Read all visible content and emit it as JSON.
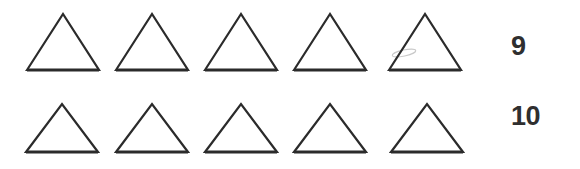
{
  "worksheet": {
    "background_color": "#ffffff",
    "width": 580,
    "height": 169,
    "shape_name": "triangle",
    "stroke_color": "#2b2b2b",
    "stroke_width": 2.2,
    "fill_color": "none",
    "label_color": "#2f2f2f",
    "smudge_color": "#c9c9c9"
  },
  "rows": [
    {
      "row_index": 1,
      "count_label": "9",
      "shape_count": 5,
      "baseline_y": 70,
      "apex_y": 14,
      "shapes": [
        {
          "left": 27,
          "right": 99,
          "apex_x": 63
        },
        {
          "left": 116,
          "right": 188,
          "apex_x": 152
        },
        {
          "left": 205,
          "right": 277,
          "apex_x": 241
        },
        {
          "left": 294,
          "right": 366,
          "apex_x": 330
        },
        {
          "left": 389,
          "right": 461,
          "apex_x": 425
        }
      ],
      "artifacts": [
        {
          "type": "pencil-smudge",
          "x": 404,
          "y": 53,
          "width": 24,
          "height": 6
        }
      ]
    },
    {
      "row_index": 2,
      "count_label": "10",
      "shape_count": 5,
      "baseline_y": 152,
      "apex_y": 104,
      "shapes": [
        {
          "left": 26,
          "right": 98,
          "apex_x": 62
        },
        {
          "left": 116,
          "right": 188,
          "apex_x": 152
        },
        {
          "left": 205,
          "right": 277,
          "apex_x": 241
        },
        {
          "left": 294,
          "right": 366,
          "apex_x": 330
        },
        {
          "left": 391,
          "right": 463,
          "apex_x": 427
        }
      ],
      "artifacts": []
    }
  ]
}
